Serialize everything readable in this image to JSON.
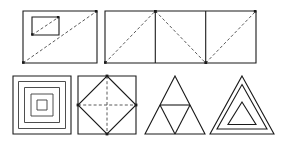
{
  "plate": {
    "title": "Geometric Figures Plate",
    "width": 283,
    "height": 148,
    "background_color": "#ffffff",
    "stroke_color": "#1a1a1a",
    "dashed_stroke_color": "#5a5a5a",
    "rows": 2,
    "figure_count": 6,
    "caption": ""
  },
  "figures": [
    {
      "id": "figure-1",
      "name": "rectangle-with-nested-rectangle-and-parallel-diagonals",
      "row": 1,
      "index": 1,
      "shape": "rectangle",
      "label": "Rectangle with inner rectangle and parallel dashed diagonals",
      "outer_rect": {
        "x": 23,
        "y": 11,
        "w": 74,
        "h": 52
      },
      "inner_rect": {
        "x": 32,
        "y": 17,
        "w": 27,
        "h": 18
      },
      "dashed_lines": [
        {
          "from": [
            23,
            63
          ],
          "to": [
            97,
            11
          ],
          "note": "main diagonal bottom-left to top-right"
        },
        {
          "from": [
            32,
            35
          ],
          "to": [
            59,
            17
          ],
          "note": "inner diagonal bottom-left to top-right"
        }
      ],
      "vertex_dots": [
        [
          23,
          63
        ],
        [
          97,
          11
        ],
        [
          32,
          35
        ],
        [
          59,
          17
        ]
      ]
    },
    {
      "id": "figure-2",
      "name": "rectangle-divided-in-three-with-zigzag-diagonals",
      "row": 1,
      "index": 2,
      "shape": "rectangle",
      "label": "Wide rectangle split into three cells with zigzag dashed diagonals",
      "outer_rect": {
        "x": 105,
        "y": 11,
        "w": 151,
        "h": 52
      },
      "divisions": 3,
      "divider_lines": [
        {
          "from": [
            155.3,
            11
          ],
          "to": [
            155.3,
            63
          ]
        },
        {
          "from": [
            205.7,
            11
          ],
          "to": [
            205.7,
            63
          ]
        }
      ],
      "dashed_lines": [
        {
          "from": [
            105,
            63
          ],
          "to": [
            155.3,
            11
          ],
          "note": "up to top of first divider"
        },
        {
          "from": [
            155.3,
            11
          ],
          "to": [
            205.7,
            63
          ],
          "note": "down to bottom of second divider"
        },
        {
          "from": [
            205.7,
            63
          ],
          "to": [
            256,
            11
          ],
          "note": "up to top-right corner"
        }
      ],
      "vertex_dots": [
        [
          105,
          63
        ],
        [
          155.3,
          11
        ],
        [
          205.7,
          63
        ],
        [
          256,
          11
        ]
      ]
    },
    {
      "id": "figure-3",
      "name": "concentric-squares",
      "row": 2,
      "index": 1,
      "shape": "square",
      "label": "Five concentric squares",
      "center": [
        42,
        105
      ],
      "ring_count": 5,
      "ring_half_sizes": [
        29,
        23.5,
        17.5,
        11,
        5
      ]
    },
    {
      "id": "figure-4",
      "name": "square-with-inscribed-diamond-and-dashed-axes",
      "row": 2,
      "index": 2,
      "shape": "square",
      "label": "Square with inscribed diamond and dashed center axes",
      "square": {
        "x": 78,
        "y": 76,
        "w": 58,
        "h": 58
      },
      "diamond_vertices": [
        [
          107,
          76
        ],
        [
          136,
          105
        ],
        [
          107,
          134
        ],
        [
          78,
          105
        ]
      ],
      "dashed_lines": [
        {
          "from": [
            78,
            105
          ],
          "to": [
            136,
            105
          ],
          "note": "horizontal axis"
        },
        {
          "from": [
            107,
            76
          ],
          "to": [
            107,
            134
          ],
          "note": "vertical axis"
        }
      ],
      "vertex_dots": [
        [
          107,
          76
        ],
        [
          136,
          105
        ],
        [
          107,
          134
        ],
        [
          78,
          105
        ]
      ]
    },
    {
      "id": "figure-5",
      "name": "triangle-subdivided-into-four",
      "row": 2,
      "index": 1,
      "shape": "triangle",
      "label": "Equilateral triangle subdivided into four smaller triangles",
      "vertices": [
        [
          175,
          76
        ],
        [
          205,
          134
        ],
        [
          145,
          134
        ]
      ],
      "midpoints": [
        [
          190,
          105
        ],
        [
          175,
          134
        ],
        [
          160,
          105
        ]
      ],
      "sub_triangle_count": 4
    },
    {
      "id": "figure-6",
      "name": "concentric-triangles",
      "row": 2,
      "index": 2,
      "shape": "triangle",
      "label": "Three concentric triangles",
      "ring_count": 3,
      "rings": [
        [
          [
            242,
            76
          ],
          [
            274,
            134
          ],
          [
            210,
            134
          ]
        ],
        [
          [
            242,
            84
          ],
          [
            267,
            129
          ],
          [
            217,
            129
          ]
        ],
        [
          [
            242,
            102
          ],
          [
            256,
            124
          ],
          [
            228,
            124
          ]
        ]
      ]
    }
  ]
}
